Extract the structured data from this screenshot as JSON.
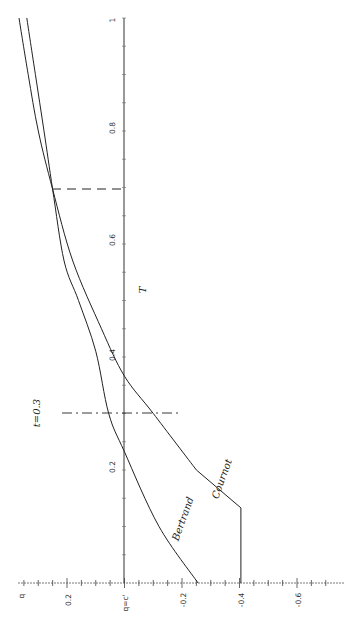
{
  "chart_data": {
    "type": "line",
    "orientation": "rotated-90-ccw",
    "title": "",
    "xlabel": "T",
    "ylabel": "q",
    "xlim": [
      0,
      1
    ],
    "ylim": [
      -0.7,
      0.3
    ],
    "x_ticks": [
      "0.2",
      "0.4",
      "0.6",
      "0.8",
      "1"
    ],
    "y_ticks": [
      "0.2",
      "q=c'",
      "-0.2",
      "-0.4",
      "-0.6"
    ],
    "baseline_label": "q=c'",
    "series": [
      {
        "name": "Bertrand",
        "x": [
          0,
          0.1,
          0.232,
          0.3,
          0.41,
          0.5,
          0.57,
          0.697,
          0.8,
          0.9,
          1.0
        ],
        "values": [
          -0.256,
          -0.12,
          0,
          0.055,
          0.1,
          0.16,
          0.21,
          0.25,
          0.28,
          0.31,
          0.34
        ]
      },
      {
        "name": "Cournot",
        "x": [
          0,
          0.133,
          0.2,
          0.3,
          0.366,
          0.45,
          0.57,
          0.697,
          0.8,
          0.9,
          1.0
        ],
        "values": [
          -0.405,
          -0.405,
          -0.25,
          -0.1,
          0,
          0.08,
          0.18,
          0.25,
          0.3,
          0.335,
          0.367
        ]
      }
    ],
    "annotations": [
      {
        "text": "t=0.3",
        "type": "vline-dashdot",
        "x": 0.3
      },
      {
        "text": "",
        "type": "vline-dashed",
        "x": 0.697,
        "note": "curves intersect"
      }
    ],
    "grid": false,
    "legend": "inline labels"
  },
  "labels": {
    "q_axis": "q",
    "t_axis": "T",
    "baseline": "q=c'",
    "t_marker": "t=0.3",
    "bertrand": "Bertrand",
    "cournot": "Cournot",
    "q_ticks": [
      "0.2",
      "-0.2",
      "-0.4",
      "-0.6"
    ],
    "t_ticks": [
      "0.2",
      "0.4",
      "0.6",
      "0.8",
      "1"
    ]
  }
}
